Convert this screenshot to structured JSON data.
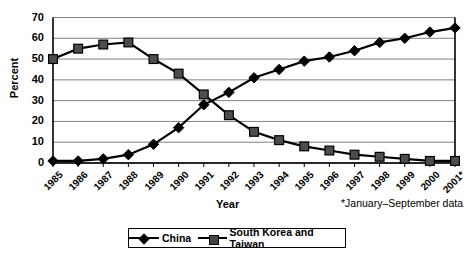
{
  "chart_data": {
    "type": "line",
    "title": "",
    "xlabel": "Year",
    "ylabel": "Percent",
    "ylim": [
      0,
      70
    ],
    "yticks": [
      0,
      10,
      20,
      30,
      40,
      50,
      60,
      70
    ],
    "grid": true,
    "legend_position": "bottom",
    "footnote": "*January–September data",
    "categories": [
      "1985",
      "1986",
      "1987",
      "1988",
      "1989",
      "1990",
      "1991",
      "1992",
      "1993",
      "1994",
      "1995",
      "1996",
      "1997",
      "1998",
      "1999",
      "2000",
      "2001*"
    ],
    "series": [
      {
        "name": "China",
        "marker": "diamond",
        "color": "#000000",
        "values": [
          1,
          1,
          2,
          4,
          9,
          17,
          28,
          34,
          41,
          45,
          49,
          51,
          54,
          58,
          60,
          63,
          65
        ]
      },
      {
        "name": "South Korea and Taiwan",
        "marker": "square",
        "color": "#4d4d4d",
        "values": [
          50,
          55,
          57,
          58,
          50,
          43,
          33,
          23,
          15,
          11,
          8,
          6,
          4,
          3,
          2,
          1,
          1
        ]
      }
    ]
  },
  "axis": {
    "ylabel": "Percent",
    "xlabel": "Year"
  },
  "legend": {
    "items": [
      {
        "label": "China"
      },
      {
        "label": "South Korea and Taiwan"
      }
    ]
  }
}
